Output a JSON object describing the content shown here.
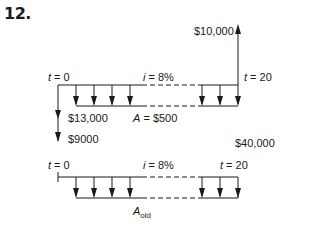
{
  "problem_number": "12.",
  "diagram_top": {
    "t_start": {
      "var": "t",
      "text": " = 0"
    },
    "t_end": {
      "var": "t",
      "text": " = 20"
    },
    "interest": {
      "var": "i",
      "text": " = 8%"
    },
    "annuity": {
      "var": "A",
      "text": " = $500"
    },
    "receipt_end": "$10,000",
    "payments_t0": [
      "$13,000",
      "$9000"
    ]
  },
  "diagram_bottom": {
    "t_start": {
      "var": "t",
      "text": " = 0"
    },
    "t_end": {
      "var": "t",
      "text": " = 20"
    },
    "interest": {
      "var": "i",
      "text": " = 8%"
    },
    "annuity": {
      "var": "A",
      "sub": "old"
    },
    "value_label": "$40,000"
  }
}
